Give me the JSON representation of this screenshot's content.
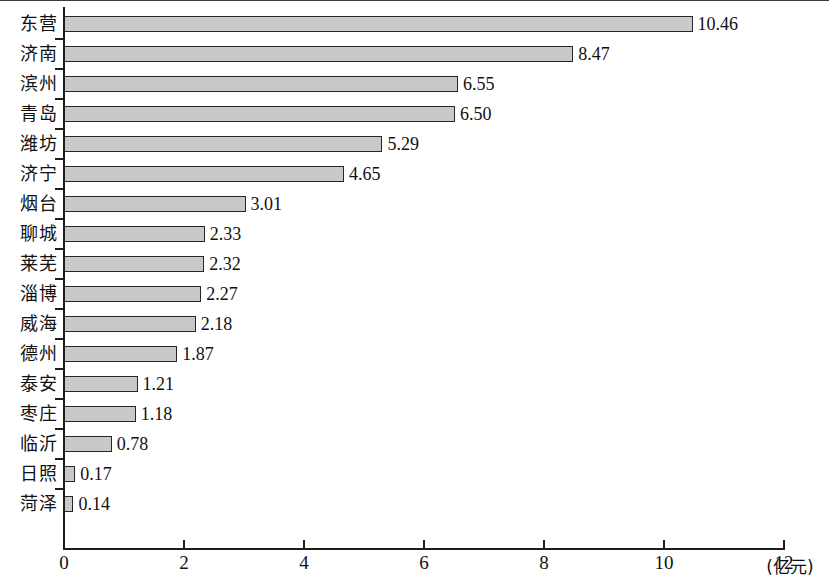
{
  "chart_data": {
    "type": "bar",
    "orientation": "horizontal",
    "title": "",
    "xlabel": "(亿元)",
    "ylabel": "",
    "xlim": [
      0,
      12
    ],
    "xticks": [
      "0",
      "2",
      "4",
      "6",
      "8",
      "10",
      "12"
    ],
    "xtick_values": [
      0,
      2,
      4,
      6,
      8,
      10,
      12
    ],
    "grid": false,
    "legend": null,
    "categories": [
      "东营",
      "济南",
      "滨州",
      "青岛",
      "潍坊",
      "济宁",
      "烟台",
      "聊城",
      "莱芜",
      "淄博",
      "威海",
      "德州",
      "泰安",
      "枣庄",
      "临沂",
      "日照",
      "菏泽"
    ],
    "values": [
      10.46,
      8.47,
      6.55,
      6.5,
      5.29,
      4.65,
      3.01,
      2.33,
      2.32,
      2.27,
      2.18,
      1.87,
      1.21,
      1.18,
      0.78,
      0.17,
      0.14
    ],
    "value_labels": [
      "10.46",
      "8.47",
      "6.55",
      "6.50",
      "5.29",
      "4.65",
      "3.01",
      "2.33",
      "2.32",
      "2.27",
      "2.18",
      "1.87",
      "1.21",
      "1.18",
      "0.78",
      "0.17",
      "0.14"
    ],
    "colors": {
      "bar_fill": "#c9c9c9",
      "bar_border": "#262626",
      "axis": "#1d1d1d",
      "text": "#111111",
      "background": "#ffffff"
    }
  }
}
